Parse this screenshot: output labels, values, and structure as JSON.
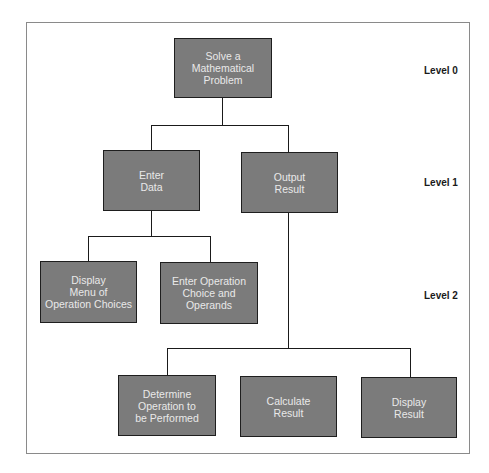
{
  "diagram": {
    "type": "hierarchy-chart",
    "levels": [
      {
        "label": "Level 0"
      },
      {
        "label": "Level 1"
      },
      {
        "label": "Level 2"
      }
    ],
    "nodes": {
      "root": {
        "label": "Solve a\nMathematical\nProblem",
        "level": 0
      },
      "enter_data": {
        "label": "Enter\nData",
        "level": 1,
        "parent": "root"
      },
      "output_result": {
        "label": "Output\nResult",
        "level": 1,
        "parent": "root"
      },
      "display_menu": {
        "label": "Display\nMenu of\nOperation Choices",
        "level": 2,
        "parent": "enter_data"
      },
      "enter_operation": {
        "label": "Enter Operation\nChoice and\nOperands",
        "level": 2,
        "parent": "enter_data"
      },
      "determine_operation": {
        "label": "Determine\nOperation to\nbe Performed",
        "level": 2,
        "parent": "output_result"
      },
      "calculate_result": {
        "label": "Calculate\nResult",
        "level": 2,
        "parent": "output_result"
      },
      "display_result": {
        "label": "Display\nResult",
        "level": 2,
        "parent": "output_result"
      }
    },
    "colors": {
      "node_fill": "#7b7b7b",
      "node_border": "#1e1e1e",
      "node_text": "#e9e9e9",
      "frame": "#8a8a8a"
    }
  }
}
